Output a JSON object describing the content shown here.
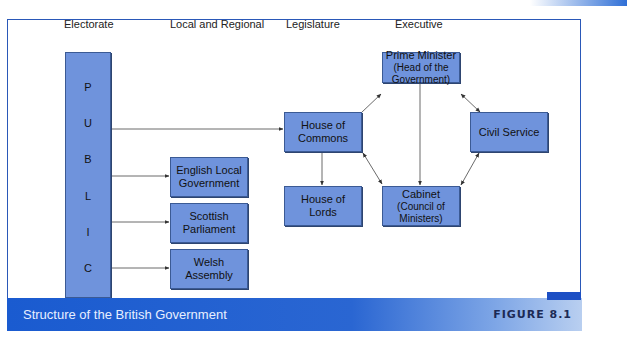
{
  "diagram": {
    "title": "Structure of the British Government",
    "figure_label": "FIGURE 8.1",
    "columns": [
      "Electorate",
      "Local and Regional",
      "Legislature",
      "Executive"
    ],
    "public_letters": [
      "P",
      "U",
      "B",
      "L",
      "I",
      "C"
    ],
    "nodes": {
      "english_local": [
        "English Local",
        "Government"
      ],
      "scottish": [
        "Scottish",
        "Parliament"
      ],
      "welsh": [
        "Welsh",
        "Assembly"
      ],
      "commons": [
        "House of",
        "Commons"
      ],
      "lords": [
        "House of",
        "Lords"
      ],
      "pm": [
        "Prime Minister",
        "(Head of the",
        "Government)"
      ],
      "cabinet": [
        "Cabinet",
        "(Council of",
        "Ministers)"
      ],
      "civil_service": [
        "Civil Service"
      ]
    },
    "edges": [
      {
        "from": "Public",
        "to": "House of Commons"
      },
      {
        "from": "Public",
        "to": "English Local Government"
      },
      {
        "from": "Public",
        "to": "Scottish Parliament"
      },
      {
        "from": "Public",
        "to": "Welsh Assembly"
      },
      {
        "from": "House of Commons",
        "to": "House of Lords"
      },
      {
        "from": "House of Commons",
        "to": "Prime Minister"
      },
      {
        "from": "House of Commons",
        "to": "Cabinet",
        "bidirectional": true
      },
      {
        "from": "Prime Minister",
        "to": "Cabinet"
      },
      {
        "from": "Prime Minister",
        "to": "Civil Service",
        "bidirectional": true
      },
      {
        "from": "Cabinet",
        "to": "Civil Service",
        "bidirectional": true
      }
    ],
    "colors": {
      "box_fill": "#6f93dc",
      "frame": "#2a58b8",
      "band": "#1a5bd0"
    }
  }
}
